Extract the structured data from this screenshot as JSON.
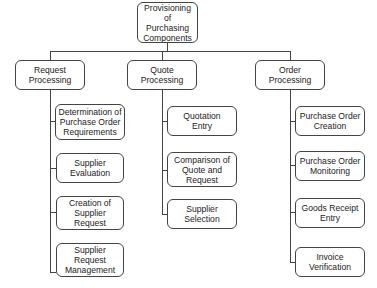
{
  "diagram": {
    "root": {
      "label": "Provisioning of\nPurchasing\nComponents"
    },
    "branches": [
      {
        "label": "Request\nProcessing",
        "children": [
          {
            "label": "Determination of\nPurchase Order\nRequirements"
          },
          {
            "label": "Supplier\nEvaluation"
          },
          {
            "label": "Creation of\nSupplier\nRequest"
          },
          {
            "label": "Supplier\nRequest\nManagement"
          }
        ]
      },
      {
        "label": "Quote\nProcessing",
        "children": [
          {
            "label": "Quotation\nEntry"
          },
          {
            "label": "Comparison of\nQuote and\nRequest"
          },
          {
            "label": "Supplier\nSelection"
          }
        ]
      },
      {
        "label": "Order\nProcessing",
        "children": [
          {
            "label": "Purchase Order\nCreation"
          },
          {
            "label": "Purchase Order\nMonitoring"
          },
          {
            "label": "Goods Receipt\nEntry"
          },
          {
            "label": "Invoice\nVerification"
          }
        ]
      }
    ]
  }
}
